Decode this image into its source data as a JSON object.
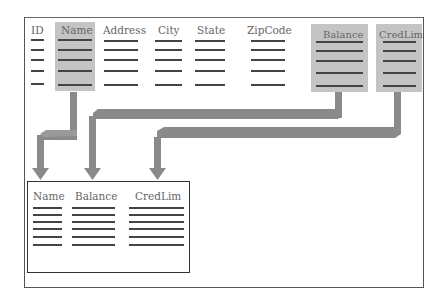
{
  "diagram": {
    "source_table": {
      "columns": [
        {
          "label": "ID",
          "highlighted": false
        },
        {
          "label": "Name",
          "highlighted": true
        },
        {
          "label": "Address",
          "highlighted": false
        },
        {
          "label": "City",
          "highlighted": false
        },
        {
          "label": "State",
          "highlighted": false
        },
        {
          "label": "ZipCode",
          "highlighted": false
        },
        {
          "label": "Balance",
          "highlighted": true
        },
        {
          "label": "CredLim",
          "highlighted": true
        }
      ],
      "row_count": 5
    },
    "result_table": {
      "columns": [
        {
          "label": "Name"
        },
        {
          "label": "Balance"
        },
        {
          "label": "CredLim"
        }
      ],
      "row_count": 6
    },
    "arrows": [
      {
        "from": "Name",
        "to": "Name"
      },
      {
        "from": "Balance",
        "to": "Balance"
      },
      {
        "from": "CredLim",
        "to": "CredLim"
      }
    ],
    "colors": {
      "highlight": "#c4c4c4",
      "arrow": "#8a8a8a",
      "line": "#444444",
      "header_text": "#666666"
    }
  }
}
